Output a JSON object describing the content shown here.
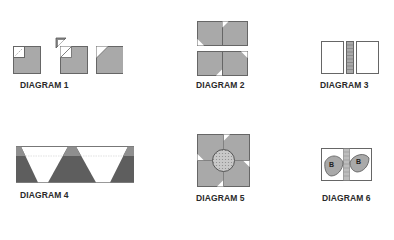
{
  "diagrams": [
    {
      "id": 1,
      "label": "DIAGRAM 1",
      "description": "Small square with corner triangle stitched, trimmed and pressed open"
    },
    {
      "id": 2,
      "label": "DIAGRAM 2",
      "description": "Four snowball-corner squares arranged in two rows"
    },
    {
      "id": 3,
      "label": "DIAGRAM 3",
      "description": "Two white rectangles with striped sashing strip between"
    },
    {
      "id": 4,
      "label": "DIAGRAM 4",
      "description": "Strip of alternating dark and white triangles"
    },
    {
      "id": 5,
      "label": "DIAGRAM 5",
      "description": "Pinwheel block with appliqued dotted circle center"
    },
    {
      "id": 6,
      "label": "DIAGRAM 6",
      "description": "Two rectangles with leaf appliques marked B, separated by striped strip"
    }
  ],
  "leaf_letters": [
    "B",
    "B"
  ],
  "colors": {
    "fabric_gray": "#a9a9a9",
    "fabric_dark": "#5e5e5e",
    "fabric_mid": "#8f8f8f",
    "outline": "#555555",
    "background": "#ffffff",
    "label_text": "#2a2a2a"
  }
}
